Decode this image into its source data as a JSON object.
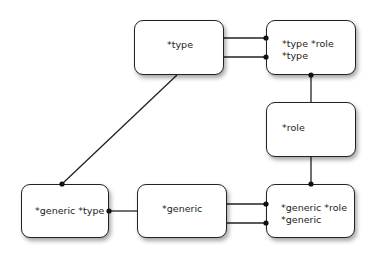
{
  "diagram": {
    "nodes": [
      {
        "id": "type",
        "lines": [
          "*type"
        ],
        "x": 134,
        "y": 20,
        "w": 90,
        "h": 55
      },
      {
        "id": "type-role",
        "lines": [
          "*type *role",
          "*type"
        ],
        "x": 266,
        "y": 20,
        "w": 90,
        "h": 55
      },
      {
        "id": "role",
        "lines": [
          "*role"
        ],
        "x": 266,
        "y": 102,
        "w": 90,
        "h": 55
      },
      {
        "id": "generic-type",
        "lines": [
          "*generic *type"
        ],
        "x": 21,
        "y": 184,
        "w": 88,
        "h": 54
      },
      {
        "id": "generic",
        "lines": [
          "*generic"
        ],
        "x": 137,
        "y": 184,
        "w": 90,
        "h": 54
      },
      {
        "id": "generic-role",
        "lines": [
          "*generic *role",
          "*generic"
        ],
        "x": 266,
        "y": 184,
        "w": 89,
        "h": 54
      }
    ],
    "edges": [
      {
        "from": "type",
        "to": "type-role",
        "note": "double line, dots at type-role end"
      },
      {
        "from": "type-role",
        "to": "role",
        "note": "dot at type-role end"
      },
      {
        "from": "role",
        "to": "generic-role",
        "note": "dot at generic-role end"
      },
      {
        "from": "type",
        "to": "generic-type",
        "note": "diagonal, dot at generic-type end"
      },
      {
        "from": "generic",
        "to": "generic-type",
        "note": "dot at generic-type end"
      },
      {
        "from": "generic",
        "to": "generic-role",
        "note": "double line, dots at generic-role end"
      }
    ],
    "colors": {
      "stroke": "#222222",
      "fill": "#ffffff",
      "background": "#ffffff"
    }
  }
}
